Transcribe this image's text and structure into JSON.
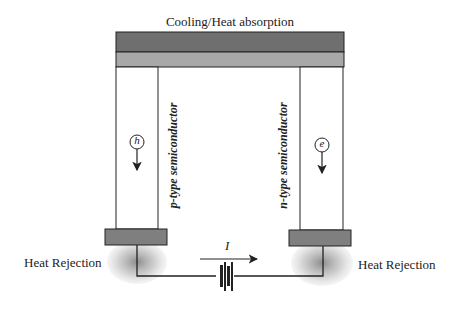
{
  "diagram": {
    "title": "Cooling/Heat absorption",
    "left_leg_label": "p-type semiconductor",
    "right_leg_label": "n-type semiconductor",
    "left_carrier": "h",
    "right_carrier": "e",
    "current_label": "I",
    "left_heat_label": "Heat Rejection",
    "right_heat_label": "Heat Rejection",
    "colors": {
      "top_plate_dark": "#6f6f6f",
      "top_plate_light": "#a8a8a8",
      "bottom_pad": "#7f7f7f",
      "line": "#222222"
    }
  }
}
